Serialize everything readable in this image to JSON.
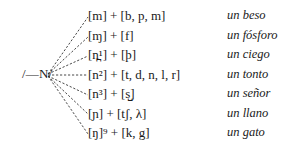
{
  "figure": {
    "source_phoneme": "/—N/",
    "rows": [
      {
        "allophone": "[m] + [b, p, m]",
        "example": "un beso"
      },
      {
        "allophone": "[ɱ] + [f]",
        "example": "un fósforo"
      },
      {
        "allophone": "[n̪¹] + [þ]",
        "example": "un ciego"
      },
      {
        "allophone": "[n²] + [t, d, n, l, r]",
        "example": "un tonto"
      },
      {
        "allophone": "[n³] + [s̺]",
        "example": "un señor"
      },
      {
        "allophone": "[ɲ] + [tʃ, λ]",
        "example": "un llano"
      },
      {
        "allophone": "[ŋ]⁹ + [k, g]",
        "example": "un gato"
      }
    ]
  }
}
